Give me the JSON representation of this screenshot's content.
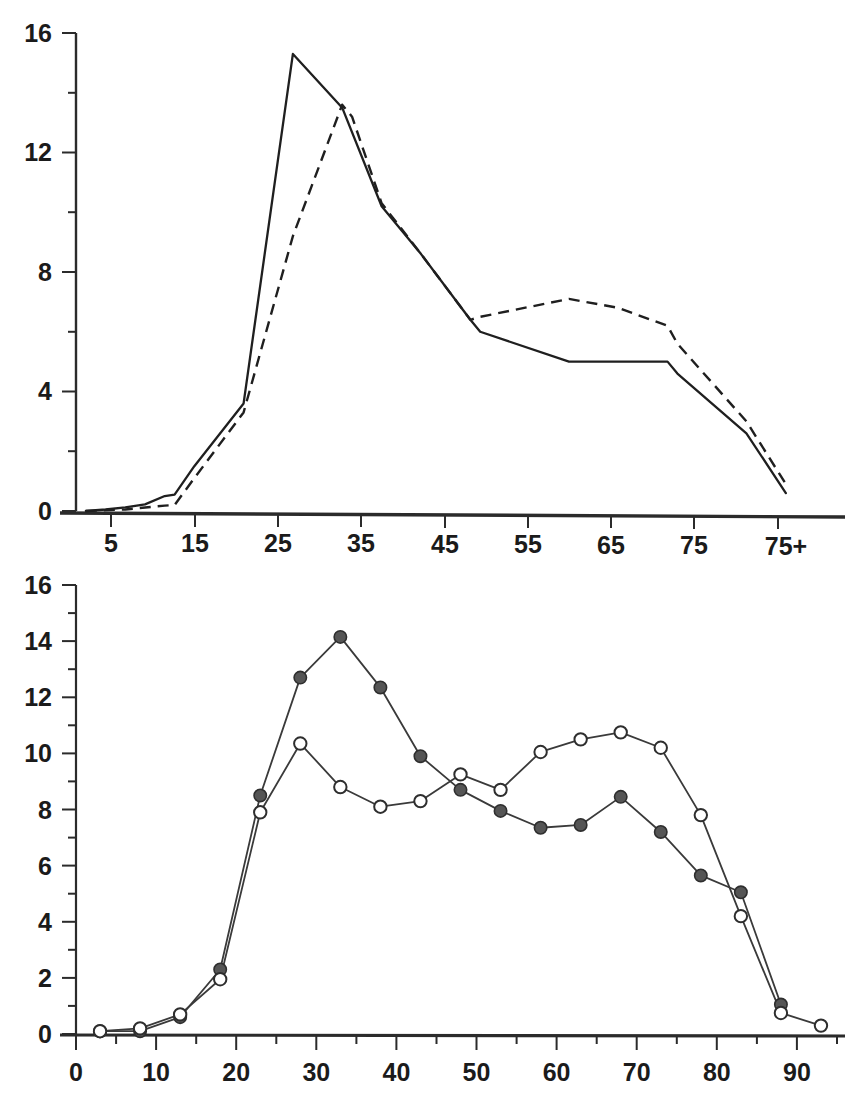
{
  "figure": {
    "panel_count": 2,
    "background_color": "#ffffff",
    "ink_color": "#1f1f1f"
  },
  "chart_data": [
    {
      "id": "top-panel",
      "type": "line",
      "title": "",
      "subtitle": "",
      "xlabel": "",
      "ylabel": "",
      "xlim": [
        0,
        78
      ],
      "ylim": [
        0,
        16
      ],
      "grid": false,
      "legend": "none",
      "x_tick_labels": [
        "5",
        "15",
        "25",
        "35",
        "45",
        "55",
        "65",
        "75",
        "75+"
      ],
      "x_tick_values": [
        5,
        15,
        25,
        35,
        45,
        55,
        65,
        75,
        77
      ],
      "y_tick_labels": [
        "0",
        "4",
        "8",
        "12",
        "16"
      ],
      "y_tick_values": [
        0,
        4,
        8,
        12,
        16
      ],
      "y_minor_ticks": [
        2,
        6,
        10,
        14
      ],
      "series": [
        {
          "name": "solid-curve",
          "style": "solid",
          "markers": "none",
          "x": [
            1,
            3,
            5,
            7,
            9,
            10,
            12,
            17,
            22,
            27,
            31,
            35,
            40,
            41,
            50,
            55,
            60,
            61,
            68,
            72
          ],
          "values": [
            0.0,
            0.05,
            0.12,
            0.22,
            0.5,
            0.55,
            1.5,
            3.6,
            15.3,
            13.5,
            10.2,
            8.6,
            6.4,
            6.0,
            5.0,
            5.0,
            5.0,
            4.6,
            2.6,
            0.6
          ]
        },
        {
          "name": "dashed-curve",
          "style": "dashed",
          "markers": "none",
          "x": [
            1,
            5,
            8,
            9,
            10,
            12,
            17,
            22,
            27,
            28,
            31,
            35,
            40,
            41,
            50,
            55,
            60,
            61,
            68,
            72
          ],
          "values": [
            0.0,
            0.05,
            0.15,
            0.18,
            0.2,
            1.1,
            3.3,
            9.2,
            13.6,
            13.2,
            10.3,
            8.6,
            6.4,
            6.5,
            7.1,
            6.8,
            6.2,
            5.6,
            3.0,
            0.9
          ]
        }
      ]
    },
    {
      "id": "bottom-panel",
      "type": "line",
      "title": "",
      "subtitle": "",
      "xlabel": "",
      "ylabel": "",
      "xlim": [
        0,
        96
      ],
      "ylim": [
        0,
        16
      ],
      "grid": false,
      "legend": "none",
      "x_tick_labels": [
        "0",
        "10",
        "20",
        "30",
        "40",
        "50",
        "60",
        "70",
        "80",
        "90"
      ],
      "x_tick_values": [
        0,
        10,
        20,
        30,
        40,
        50,
        60,
        70,
        80,
        90
      ],
      "x_minor_ticks": [
        5,
        15,
        25,
        35,
        45,
        55,
        65,
        75,
        85,
        95
      ],
      "y_tick_labels": [
        "0",
        "2",
        "4",
        "6",
        "8",
        "10",
        "12",
        "14",
        "16"
      ],
      "y_tick_values": [
        0,
        2,
        4,
        6,
        8,
        10,
        12,
        14,
        16
      ],
      "y_minor_ticks": [
        1,
        3,
        5,
        7,
        9,
        11,
        13,
        15
      ],
      "categories": [
        3,
        8,
        13,
        18,
        23,
        28,
        33,
        38,
        43,
        48,
        53,
        58,
        63,
        68,
        73,
        78,
        83,
        88,
        93
      ],
      "series": [
        {
          "name": "filled-circle-series",
          "style": "solid",
          "markers": "filled-circle",
          "x": [
            3,
            8,
            13,
            18,
            23,
            28,
            33,
            38,
            43,
            48,
            53,
            58,
            63,
            68,
            73,
            78,
            83,
            88
          ],
          "values": [
            0.1,
            0.1,
            0.6,
            2.3,
            8.5,
            12.7,
            14.15,
            12.35,
            9.9,
            8.7,
            7.95,
            7.35,
            7.45,
            8.45,
            7.2,
            5.65,
            5.05,
            1.05
          ]
        },
        {
          "name": "open-circle-series",
          "style": "solid",
          "markers": "open-circle",
          "x": [
            3,
            8,
            13,
            18,
            23,
            28,
            33,
            38,
            43,
            48,
            53,
            58,
            63,
            68,
            73,
            78,
            83,
            88,
            93
          ],
          "values": [
            0.1,
            0.2,
            0.7,
            1.95,
            7.9,
            10.35,
            8.8,
            8.1,
            8.3,
            9.25,
            8.7,
            10.05,
            10.5,
            10.75,
            10.2,
            7.8,
            4.2,
            0.75,
            0.3
          ]
        }
      ]
    }
  ]
}
